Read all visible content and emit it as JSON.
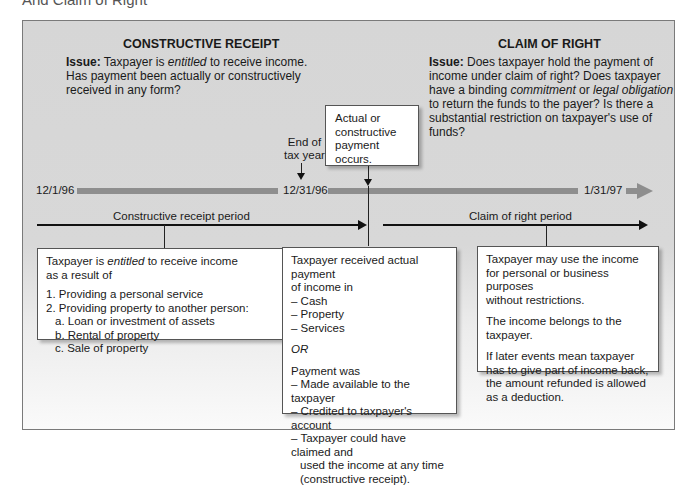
{
  "caption": "And Claim of Right",
  "constructive_receipt": {
    "heading": "CONSTRUCTIVE RECEIPT",
    "issue_label": "Issue:",
    "issue_pre": " Taxpayer is ",
    "issue_em": "entitled",
    "issue_line1_post": " to receive income.",
    "issue_line2": "Has payment been actually or constructively",
    "issue_line3": "received in any form?"
  },
  "claim_of_right": {
    "heading": "CLAIM OF RIGHT",
    "issue_label": "Issue:",
    "issue_line1": " Does taxpayer hold the payment of",
    "issue_line2": "income under claim of right? Does taxpayer",
    "issue_line3_pre": "have a binding ",
    "issue_em1": "commitment",
    "issue_mid": " or ",
    "issue_em2": "legal obligation",
    "issue_line4": "to return the funds to the payer? Is there a",
    "issue_line5": "substantial restriction on taxpayer's use of funds?"
  },
  "timeline": {
    "start": "12/1/96",
    "mid": "12/31/96",
    "end": "1/31/97",
    "end_of_tax_year_line1": "End of",
    "end_of_tax_year_line2": "tax year",
    "payment_box_line1": "Actual or",
    "payment_box_line2": "constructive",
    "payment_box_line3": "payment occurs.",
    "period_left": "Constructive receipt period",
    "period_right": "Claim of right period"
  },
  "box_left": {
    "line1_pre": "Taxpayer is ",
    "line1_em": "entitled",
    "line1_post": " to receive income",
    "line2": "as a result of",
    "items": [
      "1. Providing a personal service",
      "2. Providing property to another person:"
    ],
    "subitems": [
      "a. Loan or investment of assets",
      "b. Rental of property",
      "c. Sale of property"
    ]
  },
  "box_middle": {
    "line1": "Taxpayer received actual payment",
    "line2": "of income in",
    "forms": [
      "– Cash",
      "– Property",
      "– Services"
    ],
    "or": "OR",
    "line3": "Payment was",
    "ways": [
      "– Made available to the taxpayer",
      "– Credited to taxpayer's account",
      "– Taxpayer could have claimed and"
    ],
    "ways_cont1": "used the income at any time",
    "ways_cont2": "(constructive receipt)."
  },
  "box_right": {
    "para1_line1": "Taxpayer may use the income",
    "para1_line2": "for personal or business purposes",
    "para1_line3": "without restrictions.",
    "para2": "The income belongs to the taxpayer.",
    "para3_line1": "If later events mean taxpayer",
    "para3_line2": "has to give part of income back,",
    "para3_line3": "the amount refunded is allowed",
    "para3_line4": "as a deduction."
  }
}
